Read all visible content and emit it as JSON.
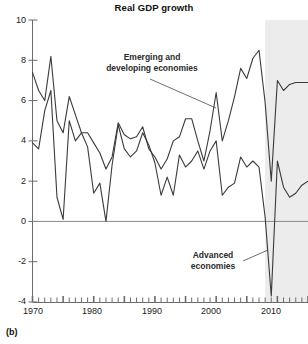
{
  "figure": {
    "panel_label": "(b)",
    "title": "Real GDP growth"
  },
  "annotations": {
    "emerging_line1": "Emerging and",
    "emerging_line2": "developing economies",
    "advanced_line1": "Advanced",
    "advanced_line2": "economies"
  },
  "axes": {
    "y_ticks": [
      "10",
      "8",
      "6",
      "4",
      "2",
      "0",
      "-2",
      "-4"
    ],
    "x_ticks": [
      "1970",
      "1980",
      "1990",
      "2000",
      "2010"
    ]
  },
  "colors": {
    "line": "#3a3a3a",
    "axis": "#6b6b6b",
    "zero_line": "#8a8a8a",
    "shade": "#ececec",
    "text": "#1a1a1a"
  },
  "chart_data": {
    "type": "line",
    "title": "Real GDP growth",
    "xlabel": "",
    "ylabel": "",
    "xlim": [
      1970,
      2015
    ],
    "ylim": [
      -4,
      10
    ],
    "yticks": [
      -4,
      -2,
      0,
      2,
      4,
      6,
      8,
      10
    ],
    "xticks": [
      1970,
      1980,
      1990,
      2000,
      2010
    ],
    "grid": false,
    "legend": "annotated-inline",
    "shaded_region": {
      "label": "projection",
      "x_start": 2008,
      "x_end": 2015,
      "color": "#ececec"
    },
    "x": [
      1970,
      1971,
      1972,
      1973,
      1974,
      1975,
      1976,
      1977,
      1978,
      1979,
      1980,
      1981,
      1982,
      1983,
      1984,
      1985,
      1986,
      1987,
      1988,
      1989,
      1990,
      1991,
      1992,
      1993,
      1994,
      1995,
      1996,
      1997,
      1998,
      1999,
      2000,
      2001,
      2002,
      2003,
      2004,
      2005,
      2006,
      2007,
      2008,
      2009,
      2010,
      2011,
      2012,
      2013,
      2014,
      2015
    ],
    "series": [
      {
        "name": "Emerging and developing economies",
        "values": [
          7.4,
          6.5,
          6.0,
          8.2,
          5.0,
          4.4,
          6.2,
          5.3,
          4.4,
          4.4,
          3.9,
          3.4,
          2.6,
          3.2,
          4.9,
          4.3,
          4.1,
          4.2,
          4.7,
          3.6,
          3.2,
          2.6,
          3.1,
          4.0,
          4.2,
          5.1,
          5.1,
          4.0,
          3.0,
          4.5,
          6.4,
          4.0,
          5.0,
          6.2,
          7.6,
          7.1,
          8.1,
          8.5,
          5.9,
          2.0,
          7.0,
          6.5,
          6.8,
          6.9,
          6.9,
          6.9
        ]
      },
      {
        "name": "Advanced economies",
        "values": [
          3.9,
          3.6,
          5.5,
          6.5,
          1.2,
          0.1,
          5.0,
          4.0,
          4.4,
          3.7,
          1.4,
          1.9,
          0.0,
          2.8,
          4.8,
          3.6,
          3.2,
          3.5,
          4.4,
          3.8,
          2.9,
          1.3,
          2.2,
          1.3,
          3.3,
          2.7,
          3.0,
          3.5,
          2.6,
          3.5,
          4.0,
          1.3,
          1.7,
          1.9,
          3.2,
          2.7,
          3.0,
          2.7,
          0.2,
          -3.7,
          3.0,
          1.7,
          1.2,
          1.4,
          1.8,
          2.0
        ]
      }
    ]
  }
}
